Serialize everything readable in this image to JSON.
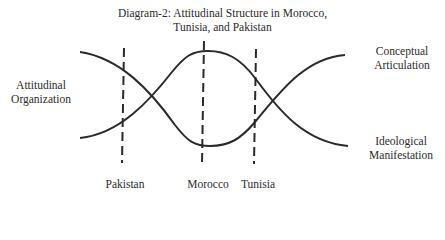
{
  "title": {
    "line1": "Diagram-2: Attitudinal Structure in Morocco,",
    "line2": "Tunisia, and Pakistan"
  },
  "left_label": {
    "line1": "Attitudinal",
    "line2": "Organization"
  },
  "right_labels": {
    "top": {
      "line1": "Conceptual",
      "line2": "Articulation"
    },
    "bottom": {
      "line1": "Ideological",
      "line2": "Manifestation"
    }
  },
  "markers": [
    {
      "label": "Pakistan",
      "x": 123
    },
    {
      "label": "Morocco",
      "x": 203
    },
    {
      "label": "Tunisia",
      "x": 255
    }
  ],
  "colors": {
    "ink": "#2a2a2a",
    "background": "#ffffff"
  }
}
